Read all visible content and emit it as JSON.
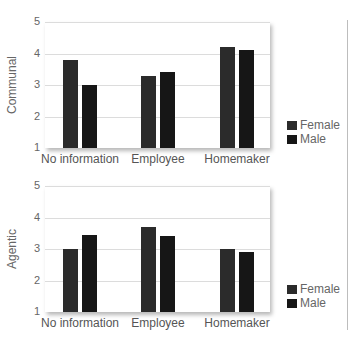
{
  "chart_data": [
    {
      "type": "bar",
      "title": "",
      "xlabel": "",
      "ylabel": "Communal",
      "ylim": [
        1,
        5
      ],
      "yticks": [
        "1",
        "2",
        "3",
        "4",
        "5"
      ],
      "categories": [
        "No information",
        "Employee",
        "Homemaker"
      ],
      "series": [
        {
          "name": "Female",
          "color": "#2b2b2b",
          "values": [
            3.8,
            3.3,
            4.2
          ]
        },
        {
          "name": "Male",
          "color": "#161616",
          "values": [
            3.0,
            3.4,
            4.1
          ]
        }
      ],
      "grid": true,
      "legend_position": "right"
    },
    {
      "type": "bar",
      "title": "",
      "xlabel": "",
      "ylabel": "Agentic",
      "ylim": [
        1,
        5
      ],
      "yticks": [
        "1",
        "2",
        "3",
        "4",
        "5"
      ],
      "categories": [
        "No information",
        "Employee",
        "Homemaker"
      ],
      "series": [
        {
          "name": "Female",
          "color": "#2b2b2b",
          "values": [
            3.0,
            3.7,
            3.0
          ]
        },
        {
          "name": "Male",
          "color": "#161616",
          "values": [
            3.45,
            3.4,
            2.9
          ]
        }
      ],
      "grid": true,
      "legend_position": "right"
    }
  ]
}
